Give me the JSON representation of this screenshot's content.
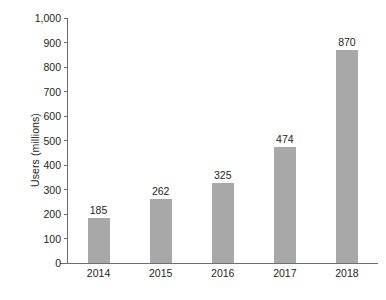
{
  "chart_data": {
    "type": "bar",
    "title": "",
    "xlabel": "",
    "ylabel": "Users (millions)",
    "categories": [
      "2014",
      "2015",
      "2016",
      "2017",
      "2018"
    ],
    "values": [
      185,
      262,
      325,
      474,
      870
    ],
    "value_labels": [
      "185",
      "262",
      "325",
      "474",
      "870"
    ],
    "ylim": [
      0,
      1000
    ],
    "ytick_values": [
      0,
      100,
      200,
      300,
      400,
      500,
      600,
      700,
      800,
      900,
      1000
    ],
    "ytick_labels": [
      "0",
      "100",
      "200",
      "300",
      "400",
      "500",
      "600",
      "700",
      "800",
      "900",
      "1,000"
    ],
    "grid": false,
    "legend": null,
    "series": [
      {
        "name": "Users",
        "values": [
          185,
          262,
          325,
          474,
          870
        ]
      }
    ],
    "colors": {
      "bar_fill": "#a8a8a8",
      "axis_line": "#6d6e71",
      "text": "#231f20",
      "background": "#ffffff"
    }
  }
}
